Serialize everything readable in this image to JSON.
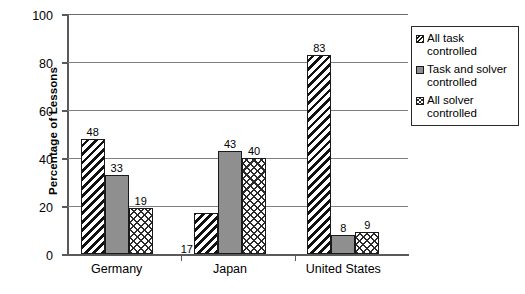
{
  "chart_data": {
    "type": "bar",
    "title": "",
    "xlabel": "",
    "ylabel": "Percentage of Lessons",
    "categories": [
      "Germany",
      "Japan",
      "United States"
    ],
    "series": [
      {
        "name": "All task controlled",
        "values": [
          48,
          17,
          83
        ],
        "fill": "diagonal-hatch"
      },
      {
        "name": "Task and solver controlled",
        "values": [
          33,
          43,
          8
        ],
        "fill": "solid-gray"
      },
      {
        "name": "All solver controlled",
        "values": [
          19,
          40,
          9
        ],
        "fill": "cross-hatch"
      }
    ],
    "ylim": [
      0,
      100
    ],
    "yticks": [
      0,
      20,
      40,
      60,
      80,
      100
    ],
    "ytick_labels": [
      "0",
      "20",
      "40",
      "60",
      "80",
      "100"
    ],
    "grid": true,
    "legend_position": "right",
    "data_labels": true
  },
  "colors": {
    "bar_solid": "#8f8f8f",
    "hatch": "#111111",
    "axis": "#5a5a5a",
    "gridline": "#808080",
    "background": "#ffffff",
    "text": "#000000"
  },
  "legend": {
    "items": [
      {
        "label": "All task controlled",
        "swatch": "diagonal-hatch-swatch"
      },
      {
        "label": "Task and solver controlled",
        "swatch": "solid-gray-swatch"
      },
      {
        "label": "All solver controlled",
        "swatch": "cross-hatch-swatch"
      }
    ]
  }
}
